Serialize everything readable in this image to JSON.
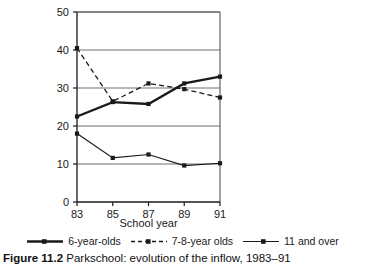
{
  "caption": {
    "prefix": "Figure 11.2",
    "text": " Parkschool: evolution of the inflow, 1983–91"
  },
  "legend": {
    "items": [
      {
        "label": "6-year-olds",
        "style": "solid-thick",
        "color": "#1a1a1a",
        "marker": "square"
      },
      {
        "label": "7-8-year olds",
        "style": "dashed",
        "color": "#1a1a1a",
        "marker": "square"
      },
      {
        "label": "11 and over",
        "style": "solid-thin",
        "color": "#1a1a1a",
        "marker": "square"
      }
    ]
  },
  "chart_data": {
    "type": "line",
    "title": "",
    "xlabel": "School year",
    "ylabel": "",
    "categories": [
      "83",
      "85",
      "87",
      "89",
      "91"
    ],
    "x": [
      83,
      85,
      87,
      89,
      91
    ],
    "xlim": [
      83,
      91
    ],
    "ylim": [
      0,
      50
    ],
    "yticks": [
      0,
      10,
      20,
      30,
      40,
      50
    ],
    "ytick_labels": [
      "0",
      "10",
      "20",
      "30",
      "40",
      "50"
    ],
    "xticks": [
      83,
      85,
      87,
      89,
      91
    ],
    "xtick_labels": [
      "83",
      "85",
      "87",
      "89",
      "91"
    ],
    "grid": "horizontal",
    "legend_position": "below",
    "series": [
      {
        "name": "6-year-olds",
        "style": "solid-thick",
        "color": "#1a1a1a",
        "values": [
          22.5,
          26.3,
          25.8,
          31.2,
          33.0
        ]
      },
      {
        "name": "7-8-year olds",
        "style": "dashed",
        "color": "#1a1a1a",
        "values": [
          40.5,
          26.5,
          31.2,
          29.7,
          27.5
        ]
      },
      {
        "name": "11 and over",
        "style": "solid-thin",
        "color": "#1a1a1a",
        "values": [
          18.0,
          11.6,
          12.5,
          9.6,
          10.2
        ]
      }
    ]
  }
}
